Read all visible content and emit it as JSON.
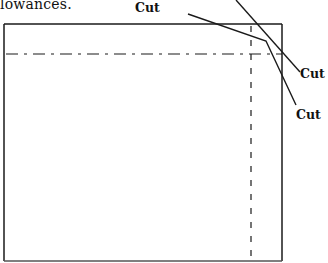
{
  "caption": "lowances.",
  "labels": {
    "cut_top": "Cut",
    "cut_right": "Cut",
    "cut_bottom": "Cut"
  },
  "diagram": {
    "outer_rectangle": {
      "left": 4,
      "top": 24,
      "right": 282,
      "bottom": 261
    },
    "seam_allowance_horizontal_y": 54,
    "seam_allowance_vertical_x": 251,
    "line_color": "#1a1a1a"
  }
}
